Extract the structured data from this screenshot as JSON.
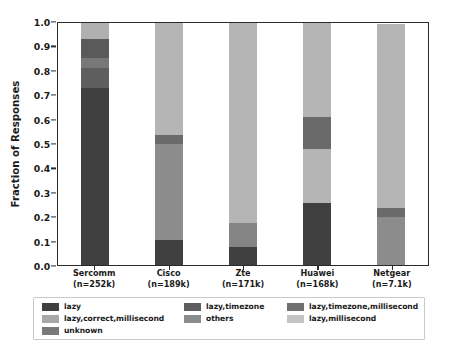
{
  "chart_data": {
    "type": "bar",
    "subtype": "stacked-bar-100pct",
    "title": "",
    "xlabel": "",
    "ylabel": "Fraction of Responses",
    "ylim": [
      0.0,
      1.0
    ],
    "ytick_labels": [
      "0.0",
      "0.1",
      "0.2",
      "0.3",
      "0.4",
      "0.5",
      "0.6",
      "0.7",
      "0.8",
      "0.9",
      "1.0"
    ],
    "ytick_values": [
      0.0,
      0.1,
      0.2,
      0.3,
      0.4,
      0.5,
      0.6,
      0.7,
      0.8,
      0.9,
      1.0
    ],
    "grid": false,
    "legend_position": "below-axes",
    "legend_columns": 3,
    "categories": [
      "Sercomm",
      "Cisco",
      "Zte",
      "Huawei",
      "Netgear"
    ],
    "category_sublabels": [
      "(n=252k)",
      "(n=189k)",
      "(n=171k)",
      "(n=168k)",
      "(n=7.1k)"
    ],
    "xtick_labels": [
      "Sercomm\n(n=252k)",
      "Cisco\n(n=189k)",
      "Zte\n(n=171k)",
      "Huawei\n(n=168k)",
      "Netgear\n(n=7.1k)"
    ],
    "series": [
      {
        "name": "lazy",
        "color": "#3f3f3f",
        "values": [
          0.73,
          0.103,
          0.075,
          0.255,
          0.0
        ]
      },
      {
        "name": "lazy,timezone",
        "color": "#5e5e5e",
        "values": [
          0.085,
          0.0,
          0.0,
          0.0,
          0.0
        ]
      },
      {
        "name": "lazy,timezone,millisecond",
        "color": "#6f6f6f",
        "values": [
          0.04,
          0.0,
          0.0,
          0.0,
          0.0
        ]
      },
      {
        "name": "lazy,correct,millisecond",
        "color": "#a8a8a8",
        "values": [
          0.0,
          0.397,
          0.1,
          0.0,
          0.2
        ]
      },
      {
        "name": "others",
        "color": "#8c8c8c",
        "values": [
          0.08,
          0.037,
          0.0,
          0.225,
          0.035
        ]
      },
      {
        "name": "lazy,millisecond",
        "color": "#bdbdbd",
        "values": [
          0.065,
          0.463,
          0.825,
          0.52,
          0.765
        ]
      },
      {
        "name": "unknown",
        "color": "#787878",
        "values": [
          0.0,
          0.0,
          0.0,
          0.0,
          0.0
        ]
      }
    ],
    "stacks": [
      {
        "category": "Sercomm",
        "segments": [
          {
            "label": "lazy",
            "from": 0.0,
            "to": 0.73,
            "value": 0.73,
            "color": "#3f3f3f"
          },
          {
            "label": "lazy,timezone",
            "from": 0.73,
            "to": 0.815,
            "value": 0.085,
            "color": "#5e5e5e"
          },
          {
            "label": "lazy,timezone,millisecond",
            "from": 0.815,
            "to": 0.855,
            "value": 0.04,
            "color": "#787878"
          },
          {
            "label": "others",
            "from": 0.855,
            "to": 0.935,
            "value": 0.08,
            "color": "#5a5a5a"
          },
          {
            "label": "lazy,millisecond",
            "from": 0.935,
            "to": 1.0,
            "value": 0.065,
            "color": "#b0b0b0"
          }
        ]
      },
      {
        "category": "Cisco",
        "segments": [
          {
            "label": "lazy",
            "from": 0.0,
            "to": 0.103,
            "value": 0.103,
            "color": "#3f3f3f"
          },
          {
            "label": "lazy,correct,millisecond",
            "from": 0.103,
            "to": 0.5,
            "value": 0.397,
            "color": "#8c8c8c"
          },
          {
            "label": "others",
            "from": 0.5,
            "to": 0.537,
            "value": 0.037,
            "color": "#6a6a6a"
          },
          {
            "label": "lazy,millisecond",
            "from": 0.537,
            "to": 1.0,
            "value": 0.463,
            "color": "#b5b5b5"
          }
        ]
      },
      {
        "category": "Zte",
        "segments": [
          {
            "label": "lazy",
            "from": 0.0,
            "to": 0.075,
            "value": 0.075,
            "color": "#3f3f3f"
          },
          {
            "label": "lazy,correct,millisecond",
            "from": 0.075,
            "to": 0.175,
            "value": 0.1,
            "color": "#858585"
          },
          {
            "label": "lazy,millisecond",
            "from": 0.175,
            "to": 1.0,
            "value": 0.825,
            "color": "#b5b5b5"
          }
        ]
      },
      {
        "category": "Huawei",
        "segments": [
          {
            "label": "lazy",
            "from": 0.0,
            "to": 0.255,
            "value": 0.255,
            "color": "#3f3f3f"
          },
          {
            "label": "lazy,millisecond",
            "from": 0.255,
            "to": 0.48,
            "value": 0.225,
            "color": "#b5b5b5"
          },
          {
            "label": "others",
            "from": 0.48,
            "to": 0.61,
            "value": 0.13,
            "color": "#6a6a6a"
          },
          {
            "label": "lazy,millisecond",
            "from": 0.61,
            "to": 1.0,
            "value": 0.39,
            "color": "#b5b5b5"
          }
        ]
      },
      {
        "category": "Netgear",
        "segments": [
          {
            "label": "lazy,correct,millisecond",
            "from": 0.0,
            "to": 0.2,
            "value": 0.2,
            "color": "#8c8c8c"
          },
          {
            "label": "others",
            "from": 0.2,
            "to": 0.235,
            "value": 0.035,
            "color": "#6a6a6a"
          },
          {
            "label": "lazy,millisecond",
            "from": 0.235,
            "to": 0.995,
            "value": 0.76,
            "color": "#b5b5b5"
          }
        ]
      }
    ],
    "legend_entries": [
      {
        "label": "lazy",
        "color": "#3f3f3f"
      },
      {
        "label": "lazy,timezone",
        "color": "#5e5e5e"
      },
      {
        "label": "lazy,timezone,millisecond",
        "color": "#6f6f6f"
      },
      {
        "label": "lazy,correct,millisecond",
        "color": "#a8a8a8"
      },
      {
        "label": "others",
        "color": "#8c8c8c"
      },
      {
        "label": "lazy,millisecond",
        "color": "#c4c4c4"
      },
      {
        "label": "unknown",
        "color": "#787878"
      }
    ]
  },
  "style": {
    "background": "#ffffff",
    "axis_color": "#2b2b2b",
    "text_color": "#1a1a1a",
    "legend_border": "#c9c9c9"
  }
}
